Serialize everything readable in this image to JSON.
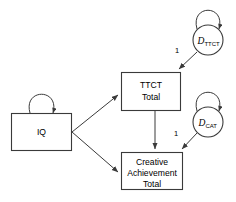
{
  "diagram": {
    "type": "path-diagram",
    "background_color": "#ffffff",
    "line_color": "#3a3a3a",
    "text_color": "#000000",
    "nodes": {
      "iq": {
        "label": "IQ",
        "shape": "rectangle"
      },
      "ttct": {
        "label_line1": "TTCT",
        "label_line2": "Total",
        "shape": "rectangle"
      },
      "creative_achievement": {
        "label_line1": "Creative",
        "label_line2": "Achievement",
        "label_line3": "Total",
        "shape": "rectangle"
      },
      "disturbance_ttct": {
        "label_main": "D",
        "label_sub": "TTCT",
        "shape": "circle"
      },
      "disturbance_cat": {
        "label_main": "D",
        "label_sub": "CAT",
        "shape": "circle"
      }
    },
    "edge_labels": {
      "disturbance_ttct_weight": "1",
      "disturbance_cat_weight": "1"
    }
  }
}
